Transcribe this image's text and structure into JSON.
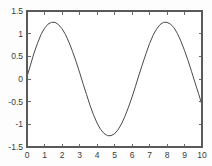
{
  "chart_data": {
    "type": "line",
    "title": "",
    "xlabel": "",
    "ylabel": "",
    "xlim": [
      0,
      10
    ],
    "ylim": [
      -1.5,
      1.5
    ],
    "grid": false,
    "legend": null,
    "xticks": [
      0,
      1,
      2,
      3,
      4,
      5,
      6,
      7,
      8,
      9,
      10
    ],
    "xtick_labels": [
      "0",
      "1",
      "2",
      "3",
      "4",
      "5",
      "6",
      "7",
      "8",
      "9",
      "10"
    ],
    "yticks": [
      -1.5,
      -1,
      -0.5,
      0,
      0.5,
      1,
      1.5
    ],
    "ytick_labels": [
      "-1.5",
      "-1",
      "-0.5",
      "0",
      "0.5",
      "1",
      "1.5"
    ],
    "series": [
      {
        "name": "waveform",
        "color": "#4a4a4a",
        "x": [
          0,
          0.2,
          0.4,
          0.6,
          0.8,
          1,
          1.2,
          1.4,
          1.6,
          1.8,
          2,
          2.2,
          2.4,
          2.6,
          2.8,
          3,
          3.2,
          3.4,
          3.6,
          3.8,
          4,
          4.2,
          4.4,
          4.6,
          4.8,
          5,
          5.2,
          5.4,
          5.6,
          5.8,
          6,
          6.2,
          6.4,
          6.6,
          6.8,
          7,
          7.2,
          7.4,
          7.6,
          7.8,
          8,
          8.2,
          8.4,
          8.6,
          8.8,
          9,
          9.2,
          9.4,
          9.6,
          9.8,
          10
        ],
        "y": [
          0.05,
          0.31,
          0.57,
          0.79,
          0.98,
          1.12,
          1.21,
          1.25,
          1.25,
          1.2,
          1.11,
          0.98,
          0.81,
          0.61,
          0.39,
          0.15,
          -0.1,
          -0.34,
          -0.58,
          -0.79,
          -0.97,
          -1.11,
          -1.2,
          -1.25,
          -1.25,
          -1.21,
          -1.12,
          -0.99,
          -0.82,
          -0.62,
          -0.4,
          -0.16,
          0.09,
          0.33,
          0.56,
          0.78,
          0.96,
          1.1,
          1.2,
          1.25,
          1.25,
          1.21,
          1.13,
          1,
          0.83,
          0.63,
          0.41,
          0.17,
          -0.08,
          -0.32,
          -0.57
        ]
      }
    ],
    "annotations": []
  },
  "figure": {
    "background_color": "#fdfdfd",
    "axis_color": "#5a5a5a",
    "curve_color": "#4a4a4a",
    "box_frame": true,
    "tick_direction": "in"
  }
}
